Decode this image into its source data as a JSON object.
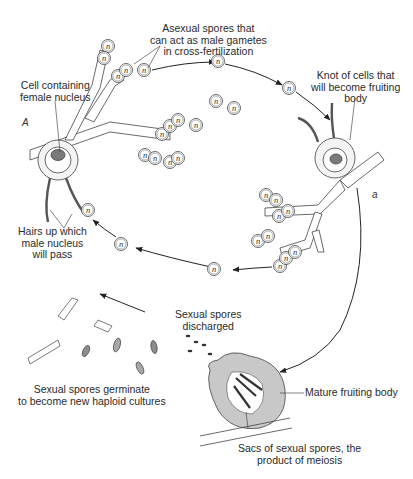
{
  "diagram": {
    "labels": {
      "asexual_spores": [
        "Asexual spores that",
        "can act as male gametes",
        "in cross-fertilization"
      ],
      "knot_of_cells": [
        "Knot of cells that",
        "will become fruiting",
        "body"
      ],
      "cell_female_nucleus": [
        "Cell containing",
        "female nucleus"
      ],
      "hairs": [
        "Hairs up which",
        "male nucleus",
        "will pass"
      ],
      "spores_discharged": [
        "Sexual spores",
        "discharged"
      ],
      "germinate": [
        "Sexual spores germinate",
        "to become new haploid cultures"
      ],
      "mature_fruiting_body": "Mature fruiting body",
      "sacs": [
        "Sacs of sexual spores, the",
        "product of meiosis"
      ]
    },
    "strain_tags": {
      "left": "A",
      "right": "a"
    },
    "cell_symbol": "n",
    "colors": {
      "ink": "#2a2a2a",
      "fruiting_body_fill": "#c8c8c8",
      "nucleus_fill": "#7a7a7a",
      "spore_fill": "#a8a8a8"
    }
  }
}
